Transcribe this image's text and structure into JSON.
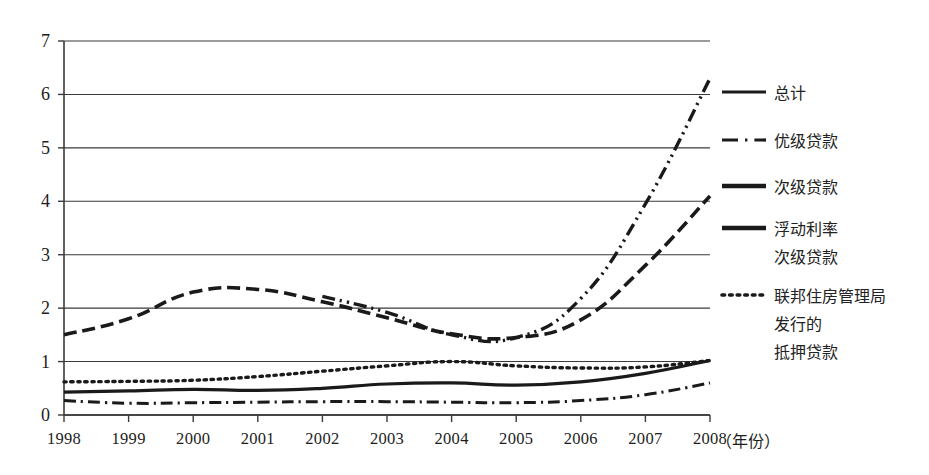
{
  "chart_data": {
    "type": "line",
    "title": "",
    "xlabel": "（年份）",
    "ylabel": "",
    "x": [
      1998,
      1999,
      2000,
      2001,
      2002,
      2003,
      2004,
      2005,
      2006,
      2007,
      2008
    ],
    "xtick_labels": [
      "1998",
      "1999",
      "2000",
      "2001",
      "2002",
      "2003",
      "2004",
      "2005",
      "2006",
      "2007",
      "2008"
    ],
    "ytick_labels": [
      "0",
      "1",
      "2",
      "3",
      "4",
      "5",
      "6",
      "7"
    ],
    "ylim": [
      0,
      7
    ],
    "yticks": [
      0,
      1,
      2,
      3,
      4,
      5,
      6,
      7
    ],
    "grid": "horizontal",
    "legend_position": "right",
    "series": [
      {
        "name": "总计",
        "style": "solid",
        "width": 3.2,
        "values": [
          0.43,
          0.45,
          0.48,
          0.46,
          0.5,
          0.58,
          0.6,
          0.56,
          0.62,
          0.78,
          1.02
        ]
      },
      {
        "name": "优级贷款",
        "style": "dash-dot",
        "width": 3.0,
        "values": [
          0.27,
          0.22,
          0.23,
          0.24,
          0.25,
          0.25,
          0.24,
          0.23,
          0.27,
          0.38,
          0.6
        ]
      },
      {
        "name": "次级贷款",
        "style": "dashed",
        "width": 3.6,
        "values": [
          1.5,
          1.8,
          2.3,
          2.35,
          2.12,
          1.82,
          1.52,
          1.45,
          1.78,
          2.8,
          4.1
        ]
      },
      {
        "name": "浮动利率次级贷款",
        "style": "dash-dot-dot",
        "width": 3.4,
        "values": [
          null,
          null,
          null,
          null,
          2.22,
          1.92,
          1.5,
          1.45,
          2.18,
          3.95,
          6.3
        ]
      },
      {
        "name": "联邦住房管理局发行的抵押贷款",
        "style": "dotted",
        "width": 3.4,
        "values": [
          0.62,
          0.63,
          0.65,
          0.72,
          0.82,
          0.92,
          1.0,
          0.92,
          0.88,
          0.9,
          1.02
        ]
      }
    ]
  },
  "axes": {
    "y_ticks": [
      "7",
      "6",
      "5",
      "4",
      "3",
      "2",
      "1",
      "0"
    ],
    "x_ticks": [
      "1998",
      "1999",
      "2000",
      "2001",
      "2002",
      "2003",
      "2004",
      "2005",
      "2006",
      "2007",
      "2008"
    ],
    "x_axis_unit": "（年份）"
  },
  "legend": {
    "items": [
      {
        "label": "总计",
        "label_lines": [
          "总计"
        ],
        "style": "solid"
      },
      {
        "label": "优级贷款",
        "label_lines": [
          "优级贷款"
        ],
        "style": "dash-dot"
      },
      {
        "label": "次级贷款",
        "label_lines": [
          "次级贷款"
        ],
        "style": "dashed"
      },
      {
        "label": "浮动利率次级贷款",
        "label_lines": [
          "浮动利率",
          "次级贷款"
        ],
        "style": "dash-thick"
      },
      {
        "label": "联邦住房管理局发行的抵押贷款",
        "label_lines": [
          "联邦住房管理局",
          "发行的",
          "抵押贷款"
        ],
        "style": "dotted"
      }
    ]
  },
  "colors": {
    "ink": "#1a1a1a",
    "grid": "#3a3a3a",
    "background": "#ffffff"
  }
}
